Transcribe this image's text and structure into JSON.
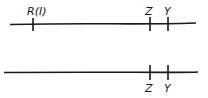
{
  "diagram": {
    "lines": [
      {
        "name": "top-line",
        "ticks": [
          {
            "label": "R(I)",
            "position": "above"
          },
          {
            "label": "Z",
            "position": "above"
          },
          {
            "label": "Y",
            "position": "above"
          }
        ]
      },
      {
        "name": "bottom-line",
        "ticks": [
          {
            "label": "Z",
            "position": "below"
          },
          {
            "label": "Y",
            "position": "below"
          }
        ]
      }
    ],
    "stroke_color": "#1a1a1a"
  }
}
